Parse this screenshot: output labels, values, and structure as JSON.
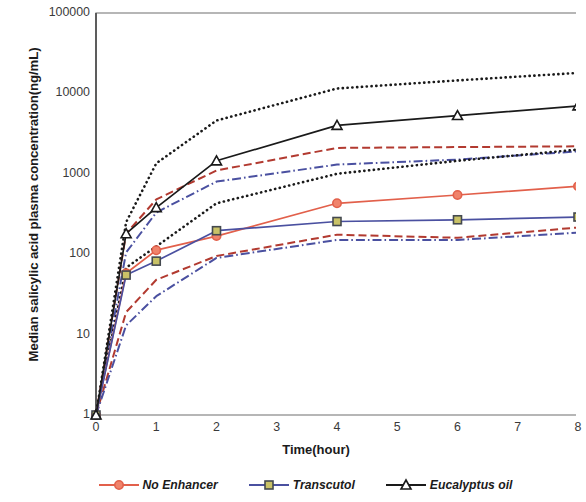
{
  "chart_data": {
    "type": "line",
    "title": "",
    "xlabel": "Time(hour)",
    "ylabel": "Median salicylic acid plasma concentration(ng/mL)",
    "xlim": [
      0,
      8
    ],
    "ylim": [
      1,
      100000
    ],
    "yscale": "log",
    "grid": false,
    "legend_position": "bottom",
    "x_ticks": [
      0,
      1,
      2,
      3,
      4,
      5,
      6,
      7,
      8
    ],
    "x_tick_labels": [
      "0",
      "1",
      "2",
      "3",
      "4",
      "5",
      "6",
      "7",
      "8"
    ],
    "y_ticks": [
      1,
      10,
      100,
      1000,
      10000,
      100000
    ],
    "y_tick_labels": [
      "1",
      "10",
      "100",
      "1000",
      "10000",
      "100000"
    ],
    "series": [
      {
        "name": "No Enhancer",
        "role": "median",
        "color": "#E2604B",
        "marker": "circle",
        "linestyle": "solid",
        "x": [
          0,
          0.5,
          1,
          2,
          4,
          6,
          8
        ],
        "values": [
          1,
          58,
          112,
          168,
          430,
          545,
          700
        ]
      },
      {
        "name": "Transcutol",
        "role": "median",
        "color": "#4A50A0",
        "marker": "square",
        "linestyle": "solid",
        "x": [
          0,
          0.5,
          1,
          2,
          4,
          6,
          8
        ],
        "values": [
          1,
          55,
          82,
          196,
          255,
          268,
          290
        ]
      },
      {
        "name": "Eucalyptus oil",
        "role": "median",
        "color": "#1a1a1a",
        "marker": "triangle",
        "linestyle": "solid",
        "x": [
          0,
          0.5,
          1,
          2,
          4,
          6,
          8
        ],
        "values": [
          1,
          180,
          380,
          1450,
          4000,
          5300,
          7000
        ]
      },
      {
        "name": "No Enhancer upper",
        "role": "upper-bound",
        "color": "#B23A30",
        "marker": "none",
        "linestyle": "dashed",
        "x": [
          0,
          0.5,
          1,
          2,
          4,
          6,
          8
        ],
        "values": [
          1,
          180,
          480,
          1100,
          2100,
          2150,
          2200
        ]
      },
      {
        "name": "No Enhancer lower",
        "role": "lower-bound",
        "color": "#B23A30",
        "marker": "none",
        "linestyle": "dashed",
        "x": [
          0,
          0.5,
          1,
          2,
          4,
          6,
          8
        ],
        "values": [
          1,
          19,
          48,
          95,
          175,
          160,
          215
        ]
      },
      {
        "name": "Transcutol upper",
        "role": "upper-bound",
        "color": "#4A50A0",
        "marker": "none",
        "linestyle": "dashdot",
        "x": [
          0,
          0.5,
          1,
          2,
          4,
          6,
          8
        ],
        "values": [
          1,
          105,
          330,
          800,
          1300,
          1500,
          1900
        ]
      },
      {
        "name": "Transcutol lower",
        "role": "lower-bound",
        "color": "#4A50A0",
        "marker": "none",
        "linestyle": "dashdot",
        "x": [
          0,
          0.5,
          1,
          2,
          4,
          6,
          8
        ],
        "values": [
          1,
          13,
          30,
          90,
          150,
          150,
          185
        ]
      },
      {
        "name": "Eucalyptus oil upper",
        "role": "upper-bound",
        "color": "#1a1a1a",
        "marker": "none",
        "linestyle": "dotted",
        "x": [
          0,
          0.5,
          1,
          2,
          4,
          6,
          8
        ],
        "values": [
          1,
          250,
          1350,
          4600,
          11500,
          14500,
          18000
        ]
      },
      {
        "name": "Eucalyptus oil lower",
        "role": "lower-bound",
        "color": "#1a1a1a",
        "marker": "none",
        "linestyle": "dotted",
        "x": [
          0,
          0.5,
          1,
          2,
          4,
          6,
          8
        ],
        "values": [
          1,
          68,
          125,
          430,
          1000,
          1450,
          2000
        ]
      }
    ]
  },
  "legend": {
    "items": [
      {
        "label": "No Enhancer",
        "color": "#E2604B",
        "marker": "circle"
      },
      {
        "label": "Transcutol",
        "color": "#4A50A0",
        "marker": "square"
      },
      {
        "label": "Eucalyptus oil",
        "color": "#1a1a1a",
        "marker": "triangle"
      }
    ]
  },
  "axes": {
    "x_title": "Time(hour)",
    "y_title": "Median salicylic acid plasma concentration(ng/mL)"
  }
}
